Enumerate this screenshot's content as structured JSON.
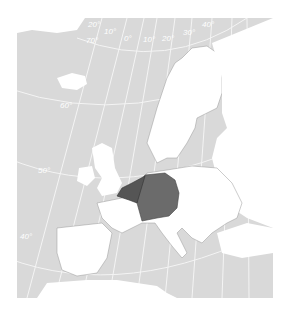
{
  "map": {
    "title": "",
    "highlighted_regions": [
      {
        "name": "Germany",
        "color": "#6b6b6b"
      },
      {
        "name": "Netherlands",
        "color": "#555555"
      },
      {
        "name": "Belgium",
        "color": "#555555"
      },
      {
        "name": "Luxembourg",
        "color": "#555555"
      }
    ],
    "colors": {
      "sea": "#d9d9d9",
      "land": "#ffffff",
      "border": "#888888",
      "graticule": "#ffffff"
    },
    "longitude_labels": [
      "20°",
      "10°",
      "0°",
      "10°",
      "20°",
      "30°",
      "40°"
    ],
    "latitude_labels": [
      "70°",
      "60°",
      "50°",
      "40°"
    ]
  }
}
